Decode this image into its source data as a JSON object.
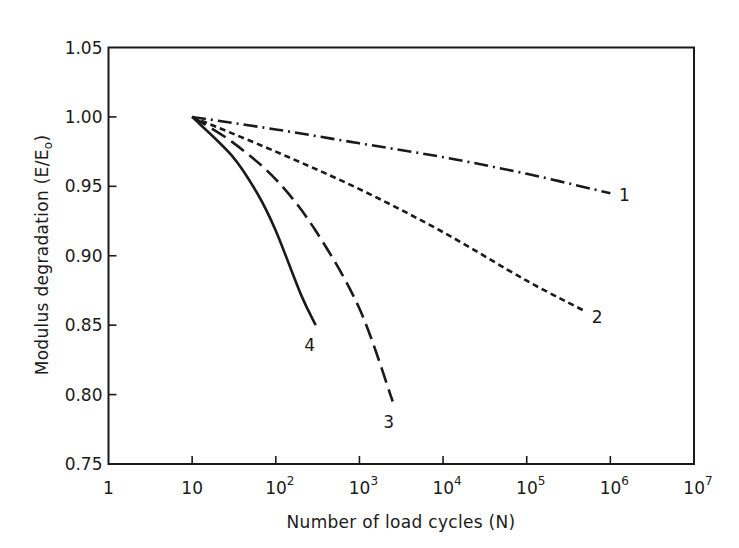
{
  "chart_data": {
    "type": "line",
    "title": "",
    "xlabel": "Number of load cycles (N)",
    "ylabel": "Modulus degradation (E/E₀)",
    "ylabel_parts": {
      "main": "Modulus degradation (E/E",
      "sub": "o",
      "close": ")"
    },
    "xscale": "log",
    "xlim": [
      1,
      10000000
    ],
    "ylim": [
      0.75,
      1.05
    ],
    "grid": false,
    "legend": "inline numeric labels at curve ends",
    "x_ticks": [
      {
        "value": 1,
        "base": "1",
        "exp": ""
      },
      {
        "value": 10,
        "base": "10",
        "exp": ""
      },
      {
        "value": 100,
        "base": "10",
        "exp": "2"
      },
      {
        "value": 1000,
        "base": "10",
        "exp": "3"
      },
      {
        "value": 10000,
        "base": "10",
        "exp": "4"
      },
      {
        "value": 100000,
        "base": "10",
        "exp": "5"
      },
      {
        "value": 1000000,
        "base": "10",
        "exp": "6"
      },
      {
        "value": 10000000,
        "base": "10",
        "exp": "7"
      }
    ],
    "y_ticks": [
      "0.75",
      "0.80",
      "0.85",
      "0.90",
      "0.95",
      "1.00",
      "1.05"
    ],
    "series": [
      {
        "name": "1",
        "style": "dash-dot",
        "x": [
          10,
          100,
          1000,
          10000,
          100000,
          1000000
        ],
        "y": [
          1.0,
          0.991,
          0.981,
          0.971,
          0.959,
          0.945
        ]
      },
      {
        "name": "2",
        "style": "short-dash",
        "x": [
          10,
          100,
          1000,
          10000,
          100000,
          500000
        ],
        "y": [
          1.0,
          0.975,
          0.948,
          0.917,
          0.882,
          0.86
        ]
      },
      {
        "name": "3",
        "style": "long-dash",
        "x": [
          10,
          30,
          100,
          300,
          1000,
          2500
        ],
        "y": [
          1.0,
          0.982,
          0.955,
          0.918,
          0.862,
          0.795
        ]
      },
      {
        "name": "4",
        "style": "solid",
        "x": [
          10,
          30,
          60,
          100,
          200,
          300
        ],
        "y": [
          1.0,
          0.972,
          0.945,
          0.918,
          0.872,
          0.85
        ]
      }
    ],
    "colors": {
      "line": "#1a1a1a",
      "background": "#ffffff"
    }
  }
}
